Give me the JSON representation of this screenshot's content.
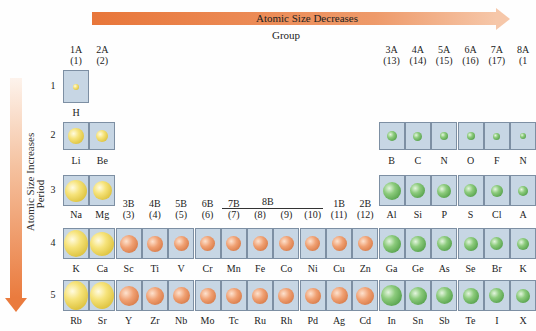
{
  "arrows": {
    "horizontal": {
      "label": "Atomic Size Decreases",
      "color": "#e8763a"
    },
    "vertical": {
      "label": "Atomic Size Increases",
      "color": "#ea7b3e"
    }
  },
  "axis_titles": {
    "group": "Group",
    "period": "Period"
  },
  "groups": [
    {
      "a": "1A",
      "b": "(1)"
    },
    {
      "a": "2A",
      "b": "(2)"
    },
    {
      "a": "3B",
      "b": "(3)"
    },
    {
      "a": "4B",
      "b": "(4)"
    },
    {
      "a": "5B",
      "b": "(5)"
    },
    {
      "a": "6B",
      "b": "(6)"
    },
    {
      "a": "7B",
      "b": "(7)"
    },
    {
      "a": "",
      "b": "(8)"
    },
    {
      "a": "",
      "b": "(9)"
    },
    {
      "a": "",
      "b": "(10)"
    },
    {
      "a": "1B",
      "b": "(11)"
    },
    {
      "a": "2B",
      "b": "(12)"
    },
    {
      "a": "3A",
      "b": "(13)"
    },
    {
      "a": "4A",
      "b": "(14)"
    },
    {
      "a": "5A",
      "b": "(15)"
    },
    {
      "a": "6A",
      "b": "(16)"
    },
    {
      "a": "7A",
      "b": "(17)"
    },
    {
      "a": "8A",
      "b": "(1"
    }
  ],
  "group_8b_label": "8B",
  "periods": [
    "1",
    "2",
    "3",
    "4",
    "5"
  ],
  "colors": {
    "s_block": "#f6e37a",
    "d_block": "#f0a072",
    "p_block": "#8ccb7c",
    "cell_bg": "#c7d6e4"
  },
  "elements": {
    "p1": [
      {
        "sym": "H",
        "col": 0,
        "size": 6,
        "type": "yellow"
      }
    ],
    "p2": [
      {
        "sym": "Li",
        "col": 0,
        "size": 16,
        "type": "yellow"
      },
      {
        "sym": "Be",
        "col": 1,
        "size": 12,
        "type": "yellow"
      },
      {
        "sym": "B",
        "col": 12,
        "size": 10,
        "type": "green"
      },
      {
        "sym": "C",
        "col": 13,
        "size": 9,
        "type": "green"
      },
      {
        "sym": "N",
        "col": 14,
        "size": 8,
        "type": "green"
      },
      {
        "sym": "O",
        "col": 15,
        "size": 8,
        "type": "green"
      },
      {
        "sym": "F",
        "col": 16,
        "size": 7,
        "type": "green"
      },
      {
        "sym": "N",
        "col": 17,
        "size": 6,
        "type": "green"
      }
    ],
    "p3": [
      {
        "sym": "Na",
        "col": 0,
        "size": 22,
        "type": "yellow"
      },
      {
        "sym": "Mg",
        "col": 1,
        "size": 19,
        "type": "yellow"
      },
      {
        "sym": "Al",
        "col": 12,
        "size": 18,
        "type": "green"
      },
      {
        "sym": "Si",
        "col": 13,
        "size": 15,
        "type": "green"
      },
      {
        "sym": "P",
        "col": 14,
        "size": 14,
        "type": "green"
      },
      {
        "sym": "S",
        "col": 15,
        "size": 13,
        "type": "green"
      },
      {
        "sym": "Cl",
        "col": 16,
        "size": 12,
        "type": "green"
      },
      {
        "sym": "A",
        "col": 17,
        "size": 10,
        "type": "green"
      }
    ],
    "p4": [
      {
        "sym": "K",
        "col": 0,
        "size": 27,
        "type": "yellow"
      },
      {
        "sym": "Ca",
        "col": 1,
        "size": 24,
        "type": "yellow"
      },
      {
        "sym": "Sc",
        "col": 2,
        "size": 18,
        "type": "copper"
      },
      {
        "sym": "Ti",
        "col": 3,
        "size": 16,
        "type": "copper"
      },
      {
        "sym": "V",
        "col": 4,
        "size": 15,
        "type": "copper"
      },
      {
        "sym": "Cr",
        "col": 5,
        "size": 15,
        "type": "copper"
      },
      {
        "sym": "Mn",
        "col": 6,
        "size": 15,
        "type": "copper"
      },
      {
        "sym": "Fe",
        "col": 7,
        "size": 15,
        "type": "copper"
      },
      {
        "sym": "Co",
        "col": 8,
        "size": 15,
        "type": "copper"
      },
      {
        "sym": "Ni",
        "col": 9,
        "size": 15,
        "type": "copper"
      },
      {
        "sym": "Cu",
        "col": 10,
        "size": 15,
        "type": "copper"
      },
      {
        "sym": "Zn",
        "col": 11,
        "size": 15,
        "type": "copper"
      },
      {
        "sym": "Ga",
        "col": 12,
        "size": 18,
        "type": "green"
      },
      {
        "sym": "Ge",
        "col": 13,
        "size": 16,
        "type": "green"
      },
      {
        "sym": "As",
        "col": 14,
        "size": 15,
        "type": "green"
      },
      {
        "sym": "Se",
        "col": 15,
        "size": 14,
        "type": "green"
      },
      {
        "sym": "Br",
        "col": 16,
        "size": 13,
        "type": "green"
      },
      {
        "sym": "K",
        "col": 17,
        "size": 12,
        "type": "green"
      }
    ],
    "p5": [
      {
        "sym": "Rb",
        "col": 0,
        "size": 29,
        "type": "yellow"
      },
      {
        "sym": "Sr",
        "col": 1,
        "size": 27,
        "type": "yellow"
      },
      {
        "sym": "Y",
        "col": 2,
        "size": 20,
        "type": "copper"
      },
      {
        "sym": "Zr",
        "col": 3,
        "size": 18,
        "type": "copper"
      },
      {
        "sym": "Nb",
        "col": 4,
        "size": 17,
        "type": "copper"
      },
      {
        "sym": "Mo",
        "col": 5,
        "size": 16,
        "type": "copper"
      },
      {
        "sym": "Tc",
        "col": 6,
        "size": 16,
        "type": "copper"
      },
      {
        "sym": "Ru",
        "col": 7,
        "size": 16,
        "type": "copper"
      },
      {
        "sym": "Rh",
        "col": 8,
        "size": 16,
        "type": "copper"
      },
      {
        "sym": "Pd",
        "col": 9,
        "size": 16,
        "type": "copper"
      },
      {
        "sym": "Ag",
        "col": 10,
        "size": 17,
        "type": "copper"
      },
      {
        "sym": "Cd",
        "col": 11,
        "size": 18,
        "type": "copper"
      },
      {
        "sym": "In",
        "col": 12,
        "size": 21,
        "type": "green"
      },
      {
        "sym": "Sn",
        "col": 13,
        "size": 18,
        "type": "green"
      },
      {
        "sym": "Sb",
        "col": 14,
        "size": 17,
        "type": "green"
      },
      {
        "sym": "Te",
        "col": 15,
        "size": 16,
        "type": "green"
      },
      {
        "sym": "I",
        "col": 16,
        "size": 15,
        "type": "green"
      },
      {
        "sym": "X",
        "col": 17,
        "size": 14,
        "type": "green"
      }
    ]
  }
}
